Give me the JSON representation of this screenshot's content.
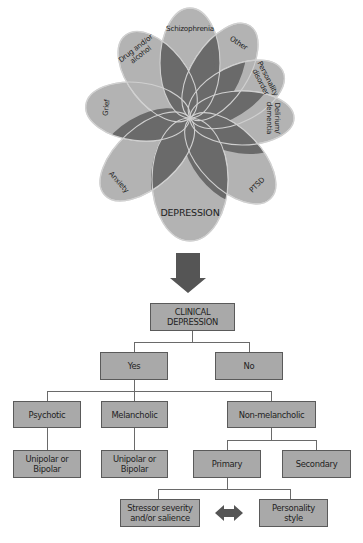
{
  "flower": {
    "fill_light": "#b3b3b3",
    "fill_dark": "#6a6a6a",
    "outline": "#d0d0d0",
    "petals": [
      {
        "label": "Schizophrenia",
        "angle": 0,
        "length": 110,
        "width": 30,
        "lines": [
          "Schizophrenia"
        ]
      },
      {
        "label": "Other",
        "angle": 33,
        "length": 110,
        "width": 28,
        "lines": [
          "Other"
        ]
      },
      {
        "label": "Personality disorder",
        "angle": 63,
        "length": 104,
        "width": 28,
        "lines": [
          "Personality",
          "disorder"
        ]
      },
      {
        "label": "Delirium/ dementia",
        "angle": 90,
        "length": 104,
        "width": 27,
        "lines": [
          "Delirium/",
          "dementia"
        ]
      },
      {
        "label": "PTSD",
        "angle": 135,
        "length": 114,
        "width": 30,
        "lines": [
          "PTSD"
        ]
      },
      {
        "label": "DEPRESSION",
        "angle": 180,
        "length": 123,
        "width": 38,
        "lines": [
          "DEPRESSION"
        ],
        "big": true
      },
      {
        "label": "Anxiety",
        "angle": 228,
        "length": 115,
        "width": 30,
        "lines": [
          "Anxiety"
        ]
      },
      {
        "label": "Grief",
        "angle": 277,
        "length": 105,
        "width": 29,
        "lines": [
          "Grief"
        ]
      },
      {
        "label": "Drug and/or alcohol",
        "angle": 322,
        "length": 105,
        "width": 29,
        "lines": [
          "Drug and/or",
          "alcohol"
        ]
      }
    ]
  },
  "arrow_color": "#555555",
  "flowchart": {
    "root": "CLINICAL DEPRESSION",
    "yes": "Yes",
    "no": "No",
    "psychotic": "Psychotic",
    "melancholic": "Melancholic",
    "non_melancholic": "Non-melancholic",
    "unipolar_bipolar_1": "Unipolar or Bipolar",
    "unipolar_bipolar_2": "Unipolar or Bipolar",
    "primary": "Primary",
    "secondary": "Secondary",
    "stressor": "Stressor severity and/or salience",
    "personality_style": "Personality style",
    "box_fill": "#a9a9a9",
    "box_border": "#5a5a5a"
  }
}
